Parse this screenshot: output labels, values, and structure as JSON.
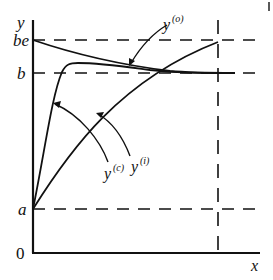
{
  "figure": {
    "axes": {
      "y_label": "y",
      "x_label": "x",
      "origin_label": "0"
    },
    "levels": [
      {
        "id": "be",
        "label": "be"
      },
      {
        "id": "b",
        "label": "b"
      },
      {
        "id": "a",
        "label": "a"
      }
    ],
    "curves": [
      {
        "id": "y_o",
        "base": "y",
        "superscript": "(o)",
        "description": "starts at be and decreases toward b"
      },
      {
        "id": "y_i",
        "base": "y",
        "superscript": "(i)",
        "description": "starts at a, rises steeply, overshoots just above b, then settles to b"
      },
      {
        "id": "y_c",
        "base": "y",
        "superscript": "(c)",
        "description": "starts at a, rises concavely toward be"
      }
    ],
    "reference_lines": {
      "horizontal": [
        "be",
        "b",
        "a"
      ],
      "vertical": "dashed vertical line near right end of x axis"
    },
    "corner_mark": "|"
  }
}
